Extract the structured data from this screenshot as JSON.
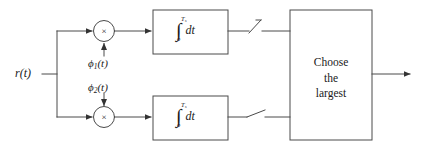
{
  "diagram": {
    "input": {
      "label": "r(t)",
      "name": "input-signal-label"
    },
    "basis_functions": [
      {
        "symbol": "ϕ",
        "subscript": "1",
        "arg": "(t)",
        "full": "ϕ1(t)"
      },
      {
        "symbol": "ϕ",
        "subscript": "2",
        "arg": "(t)",
        "full": "ϕ2(t)"
      }
    ],
    "multipliers": [
      {
        "symbol": "×",
        "name": "multiplier-top"
      },
      {
        "symbol": "×",
        "name": "multiplier-bottom"
      }
    ],
    "integrators": [
      {
        "glyph": "∫",
        "upper_limit": "T",
        "upper_limit_sub": "s",
        "lower_limit": "o",
        "differential": "dt"
      },
      {
        "glyph": "∫",
        "upper_limit": "T",
        "upper_limit_sub": "s",
        "lower_limit": "o",
        "differential": "dt"
      }
    ],
    "samplers": [
      {
        "name": "sampler-switch-top"
      },
      {
        "name": "sampler-switch-bottom"
      }
    ],
    "decision_block": {
      "line1": "Choose",
      "line2": "the",
      "line3": "largest"
    },
    "colors": {
      "stroke": "#4a4a4a",
      "text": "#1a1a1a",
      "background": "#ffffff"
    }
  }
}
